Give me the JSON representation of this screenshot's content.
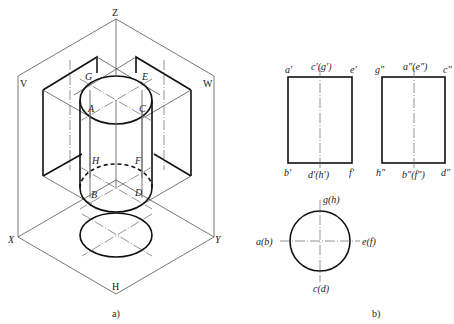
{
  "figure_a": {
    "caption": "a)",
    "planes": {
      "v": "V",
      "w": "W",
      "h": "H"
    },
    "axes": {
      "x": "X",
      "y": "Y",
      "z": "Z"
    },
    "points": {
      "g": "G",
      "e": "E",
      "a": "A",
      "c": "C",
      "h": "H",
      "f": "F",
      "b": "B",
      "d": "D"
    }
  },
  "figure_b": {
    "caption": "b)",
    "front_view": {
      "top_left": "a′",
      "top_center": "c′(g′)",
      "top_right": "e′",
      "bottom_left": "b′",
      "bottom_center": "d′(h′)",
      "bottom_right": "f′"
    },
    "side_view": {
      "top_left": "g″",
      "top_center": "a″(e″)",
      "top_right": "c″",
      "bottom_left": "h″",
      "bottom_center": "b″(f″)",
      "bottom_right": "d″"
    },
    "top_view": {
      "top": "g(h)",
      "left": "a(b)",
      "right": "e(f)",
      "bottom": "c(d)"
    }
  }
}
